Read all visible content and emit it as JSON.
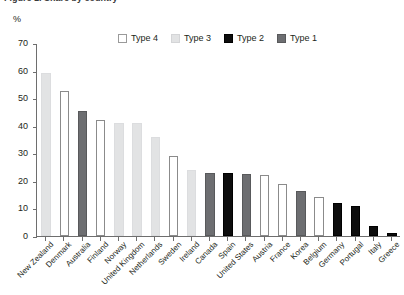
{
  "figure": {
    "clipped_title": "Figure 1. Share by country",
    "unit_label": "%"
  },
  "legend": {
    "position": "top-center",
    "items": [
      {
        "label": "Type 4",
        "key": "t4",
        "color": "#ffffff"
      },
      {
        "label": "Type 3",
        "key": "t3",
        "color": "#e2e3e4"
      },
      {
        "label": "Type 2",
        "key": "t2",
        "color": "#0d0d0d"
      },
      {
        "label": "Type 1",
        "key": "t1",
        "color": "#6d6e71"
      }
    ]
  },
  "chart_data": {
    "type": "bar",
    "title": "",
    "xlabel": "",
    "ylabel": "%",
    "ylim": [
      0,
      70
    ],
    "yticks": [
      0,
      10,
      20,
      30,
      40,
      50,
      60,
      70
    ],
    "grid": false,
    "legend_position": "top-center",
    "categories": [
      "New Zealand",
      "Denmark",
      "Australia",
      "Finland",
      "Norway",
      "United Kingdom",
      "Netherlands",
      "Sweden",
      "Ireland",
      "Canada",
      "Spain",
      "United States",
      "Austria",
      "France",
      "Korea",
      "Belgium",
      "Germany",
      "Portugal",
      "Italy",
      "Greece"
    ],
    "values": [
      59,
      52.5,
      45.5,
      42,
      41,
      41,
      36,
      29,
      24,
      23,
      23,
      22.5,
      22,
      19,
      16.5,
      14,
      12,
      11,
      3.5,
      1
    ],
    "types": [
      "Type 3",
      "Type 4",
      "Type 1",
      "Type 4",
      "Type 3",
      "Type 3",
      "Type 3",
      "Type 4",
      "Type 3",
      "Type 1",
      "Type 2",
      "Type 1",
      "Type 4",
      "Type 4",
      "Type 1",
      "Type 4",
      "Type 2",
      "Type 2",
      "Type 2",
      "Type 2"
    ]
  }
}
